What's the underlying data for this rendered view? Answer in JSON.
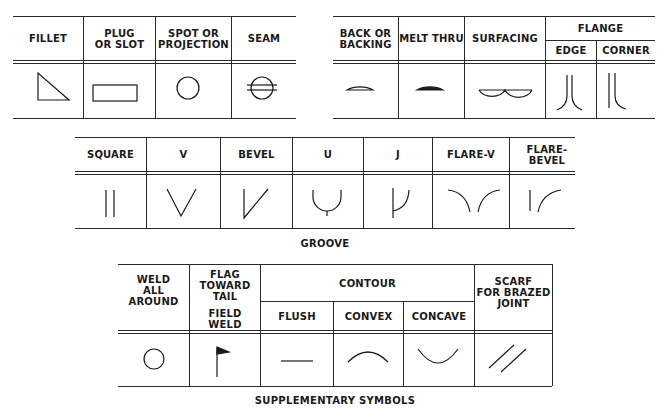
{
  "basic_symbols": {
    "columns": [
      {
        "label": "FILLET",
        "symbol": "fillet-triangle-icon"
      },
      {
        "label": "PLUG\nOR SLOT",
        "symbol": "plug-slot-rectangle-icon"
      },
      {
        "label": "SPOT OR\nPROJECTION",
        "symbol": "spot-circle-icon"
      },
      {
        "label": "SEAM",
        "symbol": "seam-circle-lines-icon"
      }
    ]
  },
  "backing_symbols": {
    "columns": [
      {
        "label": "BACK OR\nBACKING",
        "symbol": "backing-half-circle-icon"
      },
      {
        "label": "MELT THRU",
        "symbol": "melt-thru-filled-half-circle-icon"
      },
      {
        "label": "SURFACING",
        "symbol": "surfacing-double-arc-icon"
      }
    ],
    "flange": {
      "label": "FLANGE",
      "sub": [
        {
          "label": "EDGE",
          "symbol": "flange-edge-icon"
        },
        {
          "label": "CORNER",
          "symbol": "flange-corner-icon"
        }
      ]
    }
  },
  "groove": {
    "caption": "GROOVE",
    "columns": [
      {
        "label": "SQUARE",
        "symbol": "square-groove-icon"
      },
      {
        "label": "V",
        "symbol": "v-groove-icon"
      },
      {
        "label": "BEVEL",
        "symbol": "bevel-groove-icon"
      },
      {
        "label": "U",
        "symbol": "u-groove-icon"
      },
      {
        "label": "J",
        "symbol": "j-groove-icon"
      },
      {
        "label": "FLARE-V",
        "symbol": "flare-v-groove-icon"
      },
      {
        "label": "FLARE-BEVEL",
        "symbol": "flare-bevel-groove-icon"
      }
    ]
  },
  "supplementary": {
    "caption": "SUPPLEMENTARY SYMBOLS",
    "weld_all_around": {
      "label": "WELD\nALL AROUND",
      "symbol": "weld-all-around-circle-icon"
    },
    "field_weld": {
      "top_label": "FLAG\nTOWARD\nTAIL",
      "label": "FIELD WELD",
      "symbol": "field-weld-flag-icon"
    },
    "contour": {
      "label": "CONTOUR",
      "sub": [
        {
          "label": "FLUSH",
          "symbol": "flush-line-icon"
        },
        {
          "label": "CONVEX",
          "symbol": "convex-arc-icon"
        },
        {
          "label": "CONCAVE",
          "symbol": "concave-arc-icon"
        }
      ]
    },
    "scarf": {
      "label": "SCARF\nFOR BRAZED\nJOINT",
      "symbol": "scarf-double-slash-icon"
    }
  }
}
